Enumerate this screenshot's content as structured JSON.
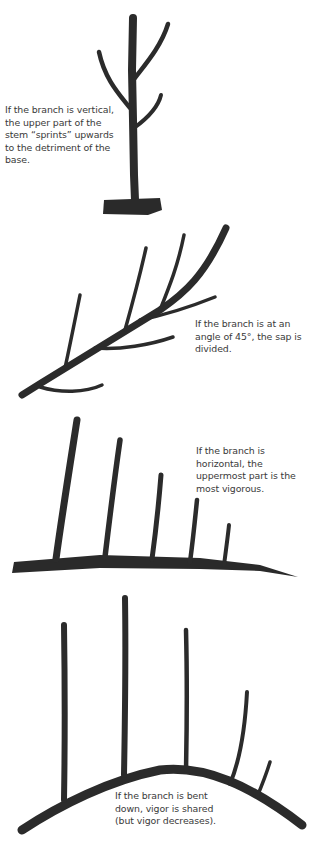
{
  "figures": [
    {
      "id": "vertical",
      "caption": "If the branch is vertical,\nthe upper part of the\nstem “sprints” upwards\nto the detriment of the\nbase.",
      "illustration": "vertical-branch-drawing"
    },
    {
      "id": "angle45",
      "caption": "If the branch is at an\nangle of 45°, the sap is\ndivided.",
      "illustration": "45-degree-branch-drawing"
    },
    {
      "id": "horizontal",
      "caption": "If the branch is\nhorizontal, the\nuppermost part is the\nmost vigorous.",
      "illustration": "horizontal-branch-drawing"
    },
    {
      "id": "bent",
      "caption": "If the branch is bent\ndown, vigor is shared\n(but vigor decreases).",
      "illustration": "bent-down-branch-drawing"
    }
  ],
  "colors": {
    "ink": "#2a2a2a",
    "text": "#3a3a3a",
    "background": "#ffffff"
  }
}
